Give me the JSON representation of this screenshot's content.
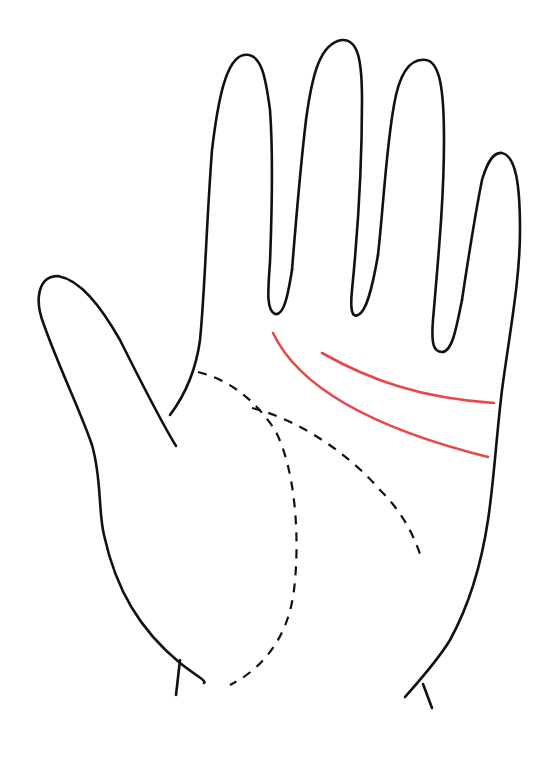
{
  "figure": {
    "background_color": "#ffffff",
    "outline_color": "#111111",
    "highlight_color": "#e8474c",
    "dashed_color": "#111111"
  },
  "lines": {
    "highlighted": [
      {
        "id": "heart-line",
        "style": "solid",
        "color": "#e8474c"
      },
      {
        "id": "head-line",
        "style": "solid",
        "color": "#e8474c"
      }
    ],
    "dashed": [
      {
        "id": "life-line",
        "style": "dashed"
      },
      {
        "id": "fate-line",
        "style": "dashed"
      }
    ]
  }
}
